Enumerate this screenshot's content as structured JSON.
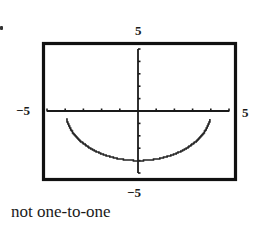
{
  "figure": {
    "window_labels": {
      "ymax": "5",
      "ymin": "−5",
      "xmin": "−5",
      "xmax": "5"
    },
    "caption": "not one-to-one",
    "colors": {
      "frame": "#111111",
      "axes": "#1a1a1a",
      "curve": "#222222",
      "background": "#ffffff"
    }
  },
  "chart_data": {
    "type": "line",
    "title": "",
    "caption": "not one-to-one",
    "xlabel": "",
    "ylabel": "",
    "xlim": [
      -5,
      5
    ],
    "ylim": [
      -5,
      5
    ],
    "xticks_step": 1,
    "yticks_step": 1,
    "grid": false,
    "legend": null,
    "function": "y = -sqrt(16 - x^2)",
    "series": [
      {
        "name": "lower semicircle",
        "x": [
          -4,
          -3.5,
          -3,
          -2.5,
          -2,
          -1.5,
          -1,
          -0.5,
          0,
          0.5,
          1,
          1.5,
          2,
          2.5,
          3,
          3.5,
          4
        ],
        "y": [
          0,
          -1.94,
          -2.65,
          -3.12,
          -3.46,
          -3.71,
          -3.87,
          -3.97,
          -4,
          -3.97,
          -3.87,
          -3.71,
          -3.46,
          -3.12,
          -2.65,
          -1.94,
          0
        ]
      }
    ],
    "annotations": [
      "5 (top)",
      "−5 (bottom)",
      "−5 (left)",
      "5 (right)"
    ]
  }
}
